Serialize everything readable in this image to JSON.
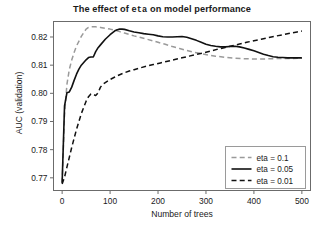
{
  "chart_data": {
    "type": "line",
    "title": "The effect of eta on model performance",
    "title_parts": {
      "prefix": "The effect of ",
      "code": "eta",
      "suffix": " on model performance"
    },
    "xlabel": "Number of trees",
    "ylabel": "AUC (validation)",
    "xlim": [
      -18,
      518
    ],
    "ylim": [
      0.7655,
      0.8255
    ],
    "xticks": [
      0,
      100,
      200,
      300,
      400,
      500
    ],
    "xtick_labels": [
      "0",
      "100",
      "200",
      "300",
      "400",
      "500"
    ],
    "yticks": [
      0.77,
      0.78,
      0.79,
      0.8,
      0.81,
      0.82
    ],
    "ytick_labels": [
      "0.77",
      "0.78",
      "0.79",
      "0.80",
      "0.81",
      "0.82"
    ],
    "grid": false,
    "legend_position": "lower right",
    "series": [
      {
        "name": "eta = 0.1",
        "color": "#9a9a9a",
        "style": "dashed",
        "width": 1.5,
        "x": [
          0,
          5,
          10,
          15,
          20,
          25,
          30,
          40,
          50,
          55,
          60,
          70,
          80,
          90,
          100,
          110,
          120,
          130,
          140,
          150,
          160,
          175,
          190,
          200,
          215,
          230,
          245,
          260,
          275,
          290,
          305,
          320,
          340,
          360,
          380,
          400,
          420,
          440,
          460,
          480,
          500
        ],
        "y": [
          0.7682,
          0.7925,
          0.8032,
          0.8085,
          0.8118,
          0.8145,
          0.8168,
          0.8202,
          0.8228,
          0.8234,
          0.8236,
          0.8236,
          0.8234,
          0.8231,
          0.8228,
          0.8224,
          0.8219,
          0.8214,
          0.8209,
          0.8204,
          0.82,
          0.8193,
          0.8186,
          0.8181,
          0.8174,
          0.8166,
          0.8159,
          0.8152,
          0.8146,
          0.8141,
          0.8136,
          0.8132,
          0.8128,
          0.8125,
          0.8123,
          0.8122,
          0.8122,
          0.8123,
          0.8124,
          0.8124,
          0.8125
        ]
      },
      {
        "name": "eta = 0.05",
        "color": "#111111",
        "style": "solid",
        "width": 1.6,
        "x": [
          0,
          5,
          10,
          15,
          20,
          25,
          30,
          35,
          40,
          50,
          55,
          60,
          65,
          70,
          75,
          80,
          90,
          100,
          110,
          115,
          120,
          125,
          130,
          140,
          150,
          160,
          170,
          180,
          190,
          200,
          210,
          220,
          230,
          240,
          250,
          260,
          270,
          280,
          290,
          300,
          310,
          320,
          330,
          340,
          350,
          360,
          370,
          380,
          390,
          400,
          410,
          420,
          430,
          440,
          450,
          460,
          470,
          480,
          490,
          500
        ],
        "y": [
          0.7682,
          0.7955,
          0.8002,
          0.8005,
          0.8022,
          0.8046,
          0.8068,
          0.8086,
          0.81,
          0.8119,
          0.8127,
          0.8129,
          0.8129,
          0.8148,
          0.8162,
          0.8172,
          0.8192,
          0.8208,
          0.8222,
          0.8226,
          0.8228,
          0.8228,
          0.8227,
          0.8222,
          0.8218,
          0.8215,
          0.8212,
          0.821,
          0.8208,
          0.8204,
          0.8201,
          0.82,
          0.82,
          0.8201,
          0.8202,
          0.8199,
          0.8194,
          0.8188,
          0.8181,
          0.8174,
          0.817,
          0.8167,
          0.8165,
          0.8165,
          0.8166,
          0.8167,
          0.8165,
          0.8161,
          0.8156,
          0.8151,
          0.8145,
          0.8139,
          0.8134,
          0.813,
          0.8128,
          0.8127,
          0.8126,
          0.8126,
          0.8126,
          0.8126
        ]
      },
      {
        "name": "eta = 0.01",
        "color": "#111111",
        "style": "dashed",
        "width": 1.5,
        "x": [
          0,
          5,
          10,
          20,
          30,
          40,
          50,
          55,
          60,
          65,
          70,
          75,
          80,
          85,
          90,
          100,
          110,
          120,
          130,
          140,
          150,
          160,
          175,
          190,
          205,
          220,
          235,
          250,
          265,
          280,
          295,
          310,
          325,
          340,
          355,
          370,
          385,
          400,
          415,
          430,
          445,
          460,
          475,
          490,
          500
        ],
        "y": [
          0.7678,
          0.7702,
          0.7738,
          0.7808,
          0.7872,
          0.7928,
          0.7972,
          0.7988,
          0.7998,
          0.7996,
          0.7992,
          0.8002,
          0.8022,
          0.8032,
          0.8038,
          0.8049,
          0.8058,
          0.8066,
          0.8073,
          0.8079,
          0.8084,
          0.8089,
          0.8096,
          0.8102,
          0.8108,
          0.8114,
          0.812,
          0.8126,
          0.8132,
          0.8138,
          0.8144,
          0.815,
          0.8157,
          0.8163,
          0.8169,
          0.8175,
          0.8181,
          0.8187,
          0.8192,
          0.8198,
          0.8203,
          0.8208,
          0.8213,
          0.8218,
          0.8221
        ]
      }
    ]
  },
  "legend": {
    "entries": [
      {
        "label": "eta = 0.1"
      },
      {
        "label": "eta = 0.05"
      },
      {
        "label": "eta = 0.01"
      }
    ]
  }
}
